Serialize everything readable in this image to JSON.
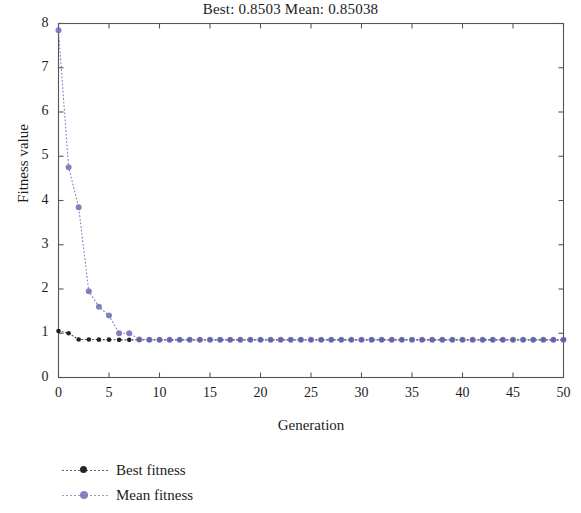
{
  "chart_data": {
    "type": "line",
    "title": "Best: 0.8503 Mean: 0.85038",
    "xlabel": "Generation",
    "ylabel": "Fitness value",
    "xlim": [
      0,
      50
    ],
    "ylim": [
      0,
      8
    ],
    "xticks": [
      0,
      5,
      10,
      15,
      20,
      25,
      30,
      35,
      40,
      45,
      50
    ],
    "yticks": [
      0,
      1,
      2,
      3,
      4,
      5,
      6,
      7,
      8
    ],
    "xtick_labels": [
      "0",
      "5",
      "10",
      "15",
      "20",
      "25",
      "30",
      "35",
      "40",
      "45",
      "50"
    ],
    "ytick_labels": [
      "0",
      "1",
      "2",
      "3",
      "4",
      "5",
      "6",
      "7",
      "8"
    ],
    "grid": false,
    "legend_position": "below-left",
    "linestyle": "dotted",
    "marker": "dot",
    "x": [
      0,
      1,
      2,
      3,
      4,
      5,
      6,
      7,
      8,
      9,
      10,
      11,
      12,
      13,
      14,
      15,
      16,
      17,
      18,
      19,
      20,
      21,
      22,
      23,
      24,
      25,
      26,
      27,
      28,
      29,
      30,
      31,
      32,
      33,
      34,
      35,
      36,
      37,
      38,
      39,
      40,
      41,
      42,
      43,
      44,
      45,
      46,
      47,
      48,
      49,
      50
    ],
    "series": [
      {
        "name": "Best fitness",
        "color": "#1a1a1a",
        "values": [
          1.05,
          1.0,
          0.86,
          0.86,
          0.855,
          0.855,
          0.8505,
          0.8503,
          0.8503,
          0.8503,
          0.8503,
          0.8503,
          0.8503,
          0.8503,
          0.8503,
          0.8503,
          0.8503,
          0.8503,
          0.8503,
          0.8503,
          0.8503,
          0.8503,
          0.8503,
          0.8503,
          0.8503,
          0.8503,
          0.8503,
          0.8503,
          0.8503,
          0.8503,
          0.8503,
          0.8503,
          0.8503,
          0.8503,
          0.8503,
          0.8503,
          0.8503,
          0.8503,
          0.8503,
          0.8503,
          0.8503,
          0.8503,
          0.8503,
          0.8503,
          0.8503,
          0.8503,
          0.8503,
          0.8503,
          0.8503,
          0.8503,
          0.8503
        ]
      },
      {
        "name": "Mean fitness",
        "color": "#6d6db5",
        "values": [
          7.85,
          4.75,
          3.85,
          1.95,
          1.6,
          1.4,
          1.0,
          1.0,
          0.86,
          0.855,
          0.8506,
          0.8504,
          0.8504,
          0.8504,
          0.8504,
          0.8504,
          0.8504,
          0.8504,
          0.8504,
          0.8504,
          0.8504,
          0.8504,
          0.8504,
          0.8504,
          0.8504,
          0.8504,
          0.8504,
          0.8504,
          0.8504,
          0.8504,
          0.8504,
          0.8504,
          0.8504,
          0.8504,
          0.8504,
          0.8504,
          0.8504,
          0.8504,
          0.8504,
          0.8504,
          0.8504,
          0.8504,
          0.8504,
          0.8504,
          0.8504,
          0.8504,
          0.8504,
          0.8504,
          0.8504,
          0.8504,
          0.85038
        ]
      }
    ]
  },
  "legend": {
    "items": [
      {
        "label": "Best fitness",
        "color": "#1a1a1a"
      },
      {
        "label": "Mean fitness",
        "color": "#6d6db5"
      }
    ]
  },
  "colors": {
    "axis": "#555555",
    "text": "#1c1c1c",
    "best": "#1a1a1a",
    "mean": "#6d6db5",
    "background": "#ffffff"
  }
}
